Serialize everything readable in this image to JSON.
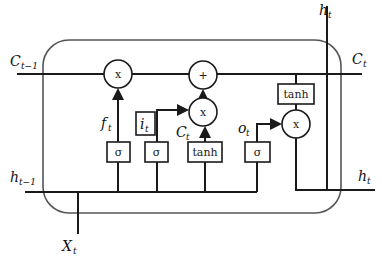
{
  "diagram": {
    "type": "LSTM cell",
    "labels": {
      "c_prev": {
        "main": "C",
        "sub": "t−1"
      },
      "c_out": {
        "main": "C",
        "sub": "t"
      },
      "h_prev": {
        "main": "h",
        "sub": "t−1"
      },
      "h_top": {
        "main": "h",
        "sub": "t"
      },
      "h_out": {
        "main": "h",
        "sub": "t"
      },
      "x_in": {
        "main": "X",
        "sub": "t"
      },
      "f_gate": {
        "main": "f",
        "sub": "t"
      },
      "i_gate": {
        "main": "i",
        "sub": "t"
      },
      "c_cand": {
        "main": "C",
        "sub": "t"
      },
      "o_gate": {
        "main": "o",
        "sub": "t"
      }
    },
    "operators": {
      "forget_mul": "x",
      "add": "+",
      "input_mul": "x",
      "output_mul": "x"
    },
    "boxes": {
      "forget_sigma": "σ",
      "input_sigma": "σ",
      "cand_tanh": "tanh",
      "output_sigma": "σ",
      "cell_tanh": "tanh"
    }
  }
}
